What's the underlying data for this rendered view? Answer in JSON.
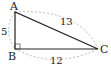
{
  "diagram": {
    "type": "right-triangle",
    "vertices": [
      {
        "label": "A",
        "x": 15,
        "y": 12
      },
      {
        "label": "B",
        "x": 15,
        "y": 49
      },
      {
        "label": "C",
        "x": 98,
        "y": 49
      }
    ],
    "sides": [
      {
        "from": "A",
        "to": "B",
        "length": "5"
      },
      {
        "from": "B",
        "to": "C",
        "length": "12"
      },
      {
        "from": "A",
        "to": "C",
        "length": "13"
      }
    ],
    "right_angle_at": "B",
    "colors": {
      "line": "#222222",
      "arc": "#999999"
    }
  }
}
